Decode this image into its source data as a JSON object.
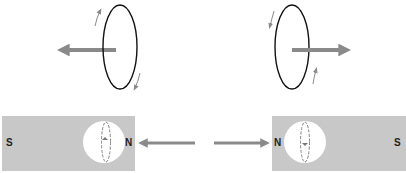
{
  "colors": {
    "arrow": "#8a8a8a",
    "magnet": "#c8c8c8",
    "ring": "#111111",
    "small_arrow": "#8a8a8a",
    "window": "#ffffff"
  },
  "top_left": {
    "ring": "current-loop",
    "arrow_direction": "left"
  },
  "top_right": {
    "ring": "current-loop",
    "arrow_direction": "right"
  },
  "magnet_left": {
    "left_pole": "S",
    "right_pole": "N",
    "arrow_direction": "left"
  },
  "magnet_right": {
    "left_pole": "N",
    "right_pole": "S",
    "arrow_direction": "right"
  }
}
